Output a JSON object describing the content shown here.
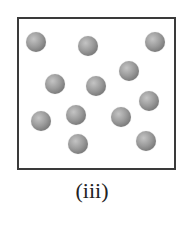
{
  "figure": {
    "label": "(iii)",
    "box": {
      "left": 17,
      "top": 17,
      "width": 155,
      "height": 149,
      "border_color": "#3a3a3a"
    },
    "sphere_color": "#9a9a9a",
    "sphere_diameter": 20,
    "particle_count": 12,
    "particles": [
      {
        "x": 36,
        "y": 42
      },
      {
        "x": 88,
        "y": 46
      },
      {
        "x": 155,
        "y": 42
      },
      {
        "x": 129,
        "y": 71
      },
      {
        "x": 55,
        "y": 84
      },
      {
        "x": 96,
        "y": 86
      },
      {
        "x": 149,
        "y": 101
      },
      {
        "x": 41,
        "y": 121
      },
      {
        "x": 76,
        "y": 115
      },
      {
        "x": 121,
        "y": 117
      },
      {
        "x": 78,
        "y": 144
      },
      {
        "x": 146,
        "y": 141
      }
    ]
  }
}
